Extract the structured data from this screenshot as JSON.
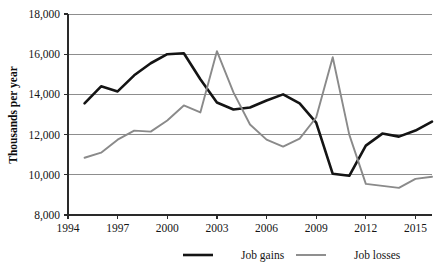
{
  "chart_data": {
    "type": "line",
    "title": "",
    "xlabel": "",
    "ylabel": "Thousands per year",
    "xlim": [
      1994,
      2016
    ],
    "ylim": [
      8000,
      18000
    ],
    "grid": true,
    "legend_position": "bottom",
    "xticks": [
      "1994",
      "1997",
      "2000",
      "2003",
      "2006",
      "2009",
      "2012",
      "2015"
    ],
    "xtick_values": [
      1994,
      1997,
      2000,
      2003,
      2006,
      2009,
      2012,
      2015
    ],
    "yticks": [
      "8,000",
      "10,000",
      "12,000",
      "14,000",
      "16,000",
      "18,000"
    ],
    "ytick_values": [
      8000,
      10000,
      12000,
      14000,
      16000,
      18000
    ],
    "x": [
      1995,
      1996,
      1997,
      1998,
      1999,
      2000,
      2001,
      2002,
      2003,
      2004,
      2005,
      2006,
      2007,
      2008,
      2009,
      2010,
      2011,
      2012,
      2013,
      2014,
      2015,
      2016
    ],
    "series": [
      {
        "name": "Job gains",
        "color": "#141414",
        "line_width": 2.6,
        "values": [
          13550,
          14400,
          14150,
          14950,
          15550,
          16000,
          16050,
          14750,
          13600,
          13250,
          13350,
          13700,
          14000,
          13550,
          12600,
          10050,
          9950,
          11450,
          12050,
          11900,
          12200,
          12650
        ]
      },
      {
        "name": "Job losses",
        "color": "#8a8a8a",
        "line_width": 1.9,
        "values": [
          10850,
          11100,
          11750,
          12200,
          12150,
          12700,
          13450,
          13100,
          16150,
          14100,
          12500,
          11750,
          11400,
          11800,
          12850,
          15850,
          12000,
          9550,
          9450,
          9350,
          9800,
          9900
        ]
      }
    ],
    "legend": [
      {
        "label": "Job gains",
        "color": "#141414",
        "line_width": 2.6
      },
      {
        "label": "Job losses",
        "color": "#8a8a8a",
        "line_width": 1.9
      }
    ]
  }
}
